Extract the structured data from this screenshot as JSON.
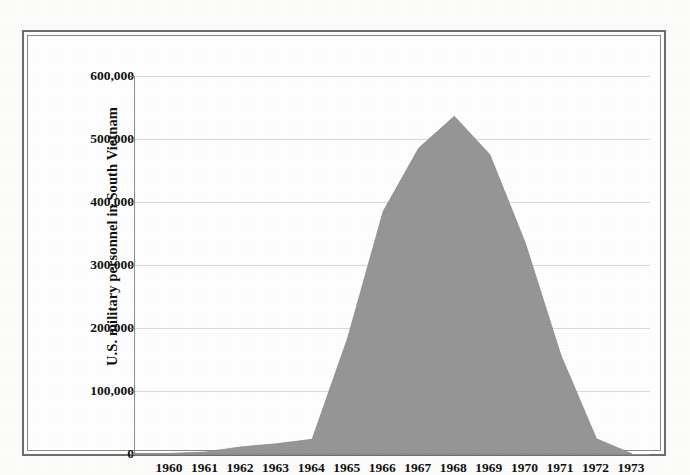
{
  "chart_data": {
    "type": "area",
    "title": "",
    "subtitle": "",
    "xlabel": "",
    "ylabel": "U.S. military personnel in South Vietnam",
    "categories": [
      "1960",
      "1961",
      "1962",
      "1963",
      "1964",
      "1965",
      "1966",
      "1967",
      "1968",
      "1969",
      "1970",
      "1971",
      "1972",
      "1973"
    ],
    "x": [
      1960,
      1961,
      1962,
      1963,
      1964,
      1965,
      1966,
      1967,
      1968,
      1969,
      1970,
      1971,
      1972,
      1973
    ],
    "values": [
      900,
      3200,
      11300,
      16300,
      23300,
      184300,
      385300,
      485600,
      536100,
      475200,
      334600,
      156800,
      24200,
      240
    ],
    "series": [
      {
        "name": "U.S. military personnel in South Vietnam",
        "values": [
          900,
          3200,
          11300,
          16300,
          23300,
          184300,
          385300,
          485600,
          536100,
          475200,
          334600,
          156800,
          24200,
          240
        ]
      }
    ],
    "ylim": [
      0,
      600000
    ],
    "xlim": [
      1960,
      1973
    ],
    "yticks": [
      0,
      100000,
      200000,
      300000,
      400000,
      500000,
      600000
    ],
    "ytick_labels": [
      "0",
      "100,000",
      "200,000",
      "300,000",
      "400,000",
      "500,000",
      "600,000"
    ],
    "grid": true,
    "legend": false,
    "legend_position": "none",
    "fill_color": "#969696",
    "gridline_color": "#d8d8d8",
    "axis_color": "#8d8d8d",
    "text_color": "#111111",
    "background_color": "#ffffff",
    "peak": {
      "year": "1968",
      "value": 536100
    }
  },
  "figure": {
    "frame_style": "double-rule-border"
  }
}
